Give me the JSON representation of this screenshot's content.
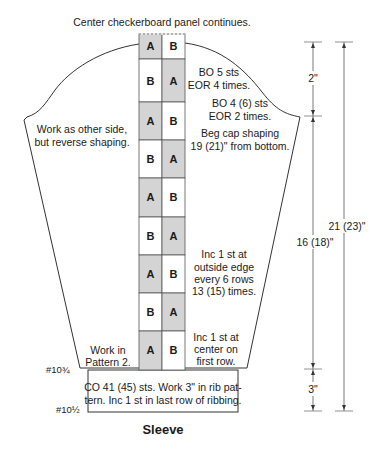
{
  "header": {
    "note": "Center checkerboard panel continues."
  },
  "title": "Sleeve",
  "colors": {
    "shaded_cell": "#d4d4d4",
    "plain_cell": "#ffffff",
    "outline": "#333333"
  },
  "checkerboard": {
    "rows": [
      {
        "left": "A",
        "right": "B"
      },
      {
        "left": "B",
        "right": "A"
      },
      {
        "left": "A",
        "right": "B"
      },
      {
        "left": "B",
        "right": "A"
      },
      {
        "left": "A",
        "right": "B"
      },
      {
        "left": "B",
        "right": "A"
      },
      {
        "left": "A",
        "right": "B"
      },
      {
        "left": "B",
        "right": "A"
      },
      {
        "left": "A",
        "right": "B"
      }
    ]
  },
  "annotations": {
    "left_cap": [
      "Work as other side,",
      "but reverse shaping."
    ],
    "bo5": [
      "BO 5 sts",
      "EOR 4 times."
    ],
    "bo4": [
      "BO 4 (6) sts",
      "EOR 2 times."
    ],
    "beg_cap": [
      "Beg cap shaping",
      "19 (21)\" from bottom."
    ],
    "inc_outside": [
      "Inc 1 st at",
      "outside edge",
      "every 6 rows",
      "13 (15) times."
    ],
    "inc_center": [
      "Inc 1 st at",
      "center on",
      "first row."
    ],
    "work_pattern": [
      "Work in",
      "Pattern 2."
    ],
    "cuff": [
      "CO 41 (45) sts. Work 3\" in rib pat-",
      "tern. Inc 1 st in last row of ribbing."
    ]
  },
  "needles": {
    "upper": "#10¾",
    "lower": "#10½"
  },
  "dimensions": {
    "cap_height": "2\"",
    "body_length": "16 (18)\"",
    "total_length": "21 (23)\"",
    "cuff_height": "3\""
  }
}
